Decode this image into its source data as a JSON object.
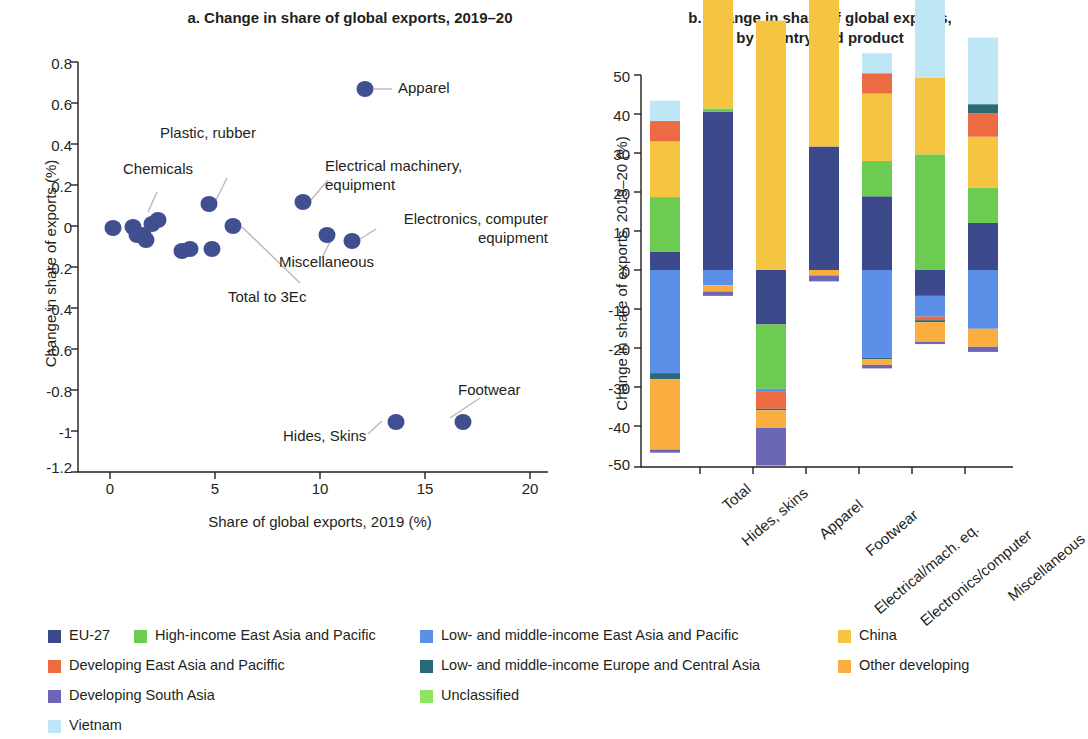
{
  "panel_a": {
    "title": "a. Change in share of global exports, 2019–20",
    "xlabel": "Share of global exports, 2019 (%)",
    "ylabel": "Change in share of exports (%)"
  },
  "panel_b": {
    "title_line1": "b. Change in share of global exports,",
    "title_line2": "by country and product",
    "ylabel": "Change in share of exports, 2019–20 (%)"
  },
  "legend": {
    "items": [
      {
        "label": "EU-27",
        "color": "#3c4a8c"
      },
      {
        "label": "High-income East Asia and Pacific",
        "color": "#6ccb51"
      },
      {
        "label": "Low- and middle-income East Asia and Pacific",
        "color": "#5c8fe8"
      },
      {
        "label": "China",
        "color": "#f5c542"
      },
      {
        "label": "Developing East Asia and Paciffic",
        "color": "#ec6b42"
      },
      {
        "label": "Low- and middle-income Europe and Central Asia",
        "color": "#2b6a75"
      },
      {
        "label": "Other developing",
        "color": "#f9ae3f"
      },
      {
        "label": "Developing South Asia",
        "color": "#6b66b5"
      },
      {
        "label": "Unclassified",
        "color": "#8ee561"
      },
      {
        "label": "Vietnam",
        "color": "#bfe6f5"
      }
    ]
  },
  "chart_data": [
    {
      "type": "scatter",
      "title": "a. Change in share of global exports, 2019–20",
      "xlabel": "Share of global exports, 2019 (%)",
      "ylabel": "Change in share of exports (%)",
      "xlim": [
        0,
        20
      ],
      "ylim": [
        -1.2,
        0.8
      ],
      "xticks": [
        0,
        5,
        10,
        15,
        20
      ],
      "yticks": [
        -1.2,
        -1.0,
        -0.8,
        -0.6,
        -0.4,
        -0.2,
        0.0,
        0.2,
        0.4,
        0.6,
        0.8
      ],
      "grid": false,
      "marker_color": "#3f4f90",
      "points": [
        {
          "x": 0.15,
          "y": -0.02,
          "label": ""
        },
        {
          "x": 1.1,
          "y": -0.01,
          "label": ""
        },
        {
          "x": 1.25,
          "y": -0.05,
          "label": ""
        },
        {
          "x": 1.5,
          "y": -0.05,
          "label": ""
        },
        {
          "x": 1.55,
          "y": -0.07,
          "label": ""
        },
        {
          "x": 1.8,
          "y": 0.01,
          "label": ""
        },
        {
          "x": 2.05,
          "y": 0.03,
          "label": "Chemicals"
        },
        {
          "x": 3.4,
          "y": -0.12,
          "label": ""
        },
        {
          "x": 3.6,
          "y": -0.11,
          "label": "Total to 3Ec"
        },
        {
          "x": 4.7,
          "y": 0.11,
          "label": "Plastic, rubber"
        },
        {
          "x": 4.8,
          "y": -0.11,
          "label": ""
        },
        {
          "x": 5.5,
          "y": 0.0,
          "label": "Miscellaneous"
        },
        {
          "x": 9.1,
          "y": 0.12,
          "label": "Electrical machinery, equipment"
        },
        {
          "x": 10.2,
          "y": -0.04,
          "label": ""
        },
        {
          "x": 11.4,
          "y": 0.7,
          "label": "Apparel"
        },
        {
          "x": 12.3,
          "y": -0.07,
          "label": "Electronics, computer equipment"
        },
        {
          "x": 12.9,
          "y": -1.0,
          "label": "Hides, Skins"
        },
        {
          "x": 16.1,
          "y": -1.0,
          "label": "Footwear"
        }
      ],
      "annotations": [
        {
          "text": "Apparel",
          "x": 11.4,
          "y": 0.7
        },
        {
          "text": "Plastic, rubber",
          "x": 4.7,
          "y": 0.11
        },
        {
          "text": "Chemicals",
          "x": 2.05,
          "y": 0.03
        },
        {
          "text": "Electrical machinery, equipment",
          "x": 9.1,
          "y": 0.12
        },
        {
          "text": "Electronics, computer equipment",
          "x": 12.3,
          "y": -0.07
        },
        {
          "text": "Miscellaneous",
          "x": 10.2,
          "y": -0.04
        },
        {
          "text": "Total to 3Ec",
          "x": 5.5,
          "y": 0.0
        },
        {
          "text": "Hides, Skins",
          "x": 12.9,
          "y": -1.0
        },
        {
          "text": "Footwear",
          "x": 16.1,
          "y": -1.0
        }
      ],
      "annotation_texts": {
        "apparel": "Apparel",
        "plastic_rubber": "Plastic, rubber",
        "chemicals": "Chemicals",
        "elec_mach_l1": "Electrical machinery,",
        "elec_mach_l2": "equipment",
        "electronics_l1": "Electronics, computer",
        "electronics_l2": "equipment",
        "miscellaneous": "Miscellaneous",
        "total_3ec": "Total to 3Ec",
        "hides_skins": "Hides, Skins",
        "footwear": "Footwear"
      }
    },
    {
      "type": "bar",
      "stacked": true,
      "title": "b. Change in share of global exports, by country and product",
      "xlabel": "",
      "ylabel": "Change in share of exports, 2019–20 (%)",
      "ylim": [
        -50,
        50
      ],
      "yticks": [
        -50,
        -40,
        -30,
        -20,
        -10,
        0,
        10,
        20,
        30,
        40,
        50
      ],
      "grid": false,
      "categories": [
        "Total",
        "Hides, skins",
        "Apparel",
        "Footwear",
        "Electrical/mach. eq.",
        "Electronics/computer",
        "Miscellaneous"
      ],
      "series": [
        {
          "name": "EU-27",
          "color": "#3c4a8c",
          "values": [
            4.6,
            40.3,
            -13.9,
            31.5,
            18.8,
            -6.6,
            12.0
          ]
        },
        {
          "name": "High-income East Asia and Pacific",
          "color": "#6ccb51",
          "values": [
            14.0,
            0.9,
            -16.4,
            0.0,
            9.0,
            29.5,
            9.0
          ]
        },
        {
          "name": "Low- and middle-income East Asia and Pacific",
          "color": "#5c8fe8",
          "values": [
            -26.3,
            -3.9,
            -0.8,
            0.0,
            -22.4,
            -5.3,
            -15.0
          ]
        },
        {
          "name": "China",
          "color": "#f5c542",
          "values": [
            14.2,
            48.7,
            63.6,
            48.0,
            17.2,
            19.5,
            13.0
          ]
        },
        {
          "name": "Developing East Asia and Paciffic",
          "color": "#ec6b42",
          "values": [
            5.2,
            5.3,
            -4.3,
            5.1,
            5.2,
            -0.9,
            6.0
          ]
        },
        {
          "name": "Low- and middle-income Europe and Central Asia",
          "color": "#2b6a75",
          "values": [
            -1.5,
            0.0,
            -0.4,
            0.0,
            -0.4,
            -0.5,
            2.3
          ]
        },
        {
          "name": "Other developing",
          "color": "#f9ae3f",
          "values": [
            -18.0,
            -1.6,
            -4.5,
            -1.4,
            -1.4,
            -5.0,
            -4.6
          ]
        },
        {
          "name": "Developing South Asia",
          "color": "#6b66b5",
          "values": [
            -0.8,
            -1.1,
            -9.6,
            -1.5,
            -0.9,
            -0.6,
            -1.3
          ]
        },
        {
          "name": "Unclassified",
          "color": "#8ee561",
          "values": [
            0.0,
            0.0,
            0.0,
            0.0,
            0.0,
            0.0,
            0.0
          ]
        },
        {
          "name": "Vietnam",
          "color": "#bfe6f5",
          "values": [
            5.2,
            1.1,
            0.0,
            10.2,
            5.1,
            21.0,
            17.0
          ]
        }
      ]
    }
  ]
}
